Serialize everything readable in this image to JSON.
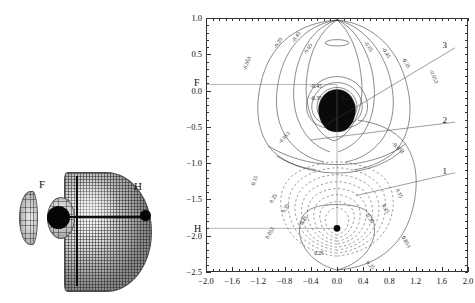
{
  "figure": {
    "panel_left": {
      "name": "3d-isosurface",
      "atom_labels": {
        "fluorine": "F",
        "hydrogen": "H"
      }
    },
    "panel_right": {
      "name": "contour-plot",
      "axis_labels": {
        "fluorine": "F",
        "hydrogen": "H"
      },
      "callouts": [
        {
          "id": "1",
          "label": "1"
        },
        {
          "id": "2",
          "label": "2"
        },
        {
          "id": "3",
          "label": "3"
        }
      ]
    }
  },
  "chart_data": {
    "type": "heatmap",
    "title": "",
    "xlabel": "",
    "ylabel": "",
    "xlim": [
      -2.0,
      2.0
    ],
    "ylim": [
      -2.5,
      1.0
    ],
    "grid": false,
    "legend": "none",
    "x_ticks": [
      -2.0,
      -1.6,
      -1.2,
      -0.8,
      -0.4,
      0.0,
      0.4,
      0.8,
      1.2,
      1.6,
      2.0
    ],
    "x_tick_labels": [
      "-2.0",
      "-1.6",
      "-1.2",
      "-0.8",
      "-0.4",
      "0.0",
      "0.4",
      "0.8",
      "1.2",
      "1.6",
      "2.0"
    ],
    "y_ticks": [
      1.0,
      0.5,
      0.0,
      -0.5,
      -1.0,
      -1.5,
      -2.0,
      -2.5
    ],
    "y_tick_labels": [
      "1.0",
      "0.5",
      "0.0",
      "-0.5",
      "-1.0",
      "-1.5",
      "-2.0",
      "-2.5"
    ],
    "x_minor_tick_step": 0.1,
    "y_minor_tick_step": 0.1,
    "contour_levels_solid": [
      -0.053,
      -0.15,
      -0.25,
      -0.35,
      -0.45,
      -0.65
    ],
    "contour_levels_dashed": [
      0.053,
      0.15,
      0.25,
      0.35,
      0.45,
      0.55
    ],
    "contour_labels_upper": [
      "-0.053",
      "-0.15",
      "-0.25",
      "-0.35",
      "-0.45",
      "-0.65"
    ],
    "contour_labels_lower": [
      "0.053",
      "0.15",
      "0.25",
      "0.35",
      "0.45"
    ],
    "nuclei": [
      {
        "label": "F",
        "x": 0.0,
        "y": 0.1
      },
      {
        "label": "H",
        "x": 0.0,
        "y": -1.9
      }
    ],
    "annotations": [
      {
        "text": "1",
        "x": 1.55,
        "y": -1.12
      },
      {
        "text": "2",
        "x": 1.55,
        "y": -0.42
      },
      {
        "text": "3",
        "x": 1.55,
        "y": 0.62
      }
    ]
  }
}
